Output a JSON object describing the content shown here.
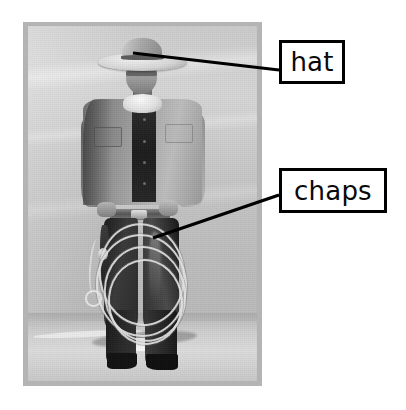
{
  "page": {
    "type": "annotated-photograph",
    "background_color": "#ffffff",
    "width": 406,
    "height": 410
  },
  "photo": {
    "name": "cowboy-photograph",
    "description": "Black and white photograph of a cowboy standing in snow, wearing a cowboy hat, denim jacket, neckerchief, leather chaps and boots, holding a coiled lasso rope",
    "border_color": "#b4b4b4",
    "frame": {
      "x": 23,
      "y": 22,
      "width": 239,
      "height": 364
    }
  },
  "callouts": [
    {
      "id": "hat",
      "label": "hat",
      "box": {
        "x": 279,
        "y": 40,
        "width": 66,
        "height": 44
      },
      "border_color": "#000000",
      "fill_color": "#ffffff",
      "text_color": "#0a0a0a",
      "leader": {
        "from_x": 133,
        "from_y": 53,
        "to_x": 279,
        "to_y": 70
      }
    },
    {
      "id": "chaps",
      "label": "chaps",
      "box": {
        "x": 279,
        "y": 168,
        "width": 108,
        "height": 45
      },
      "border_color": "#000000",
      "fill_color": "#ffffff",
      "text_color": "#0a0a0a",
      "leader": {
        "from_x": 153,
        "from_y": 238,
        "to_x": 279,
        "to_y": 195
      }
    }
  ]
}
